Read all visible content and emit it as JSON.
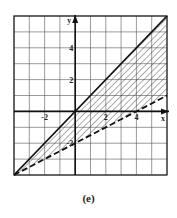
{
  "caption": "(e)",
  "chart_data": {
    "type": "line",
    "title": "",
    "xlabel": "x",
    "ylabel": "y",
    "xlim": [
      -4,
      6
    ],
    "ylim": [
      -4,
      6
    ],
    "grid": true,
    "x_ticks_labeled": [
      "-2",
      "2",
      "4"
    ],
    "y_ticks_labeled": [
      "4",
      "2",
      "-2"
    ],
    "series": [
      {
        "name": "y = x",
        "style": "solid",
        "x": [
          -4,
          6
        ],
        "y": [
          -4,
          6
        ]
      },
      {
        "name": "y = x/2 - 2",
        "style": "dashed",
        "x": [
          -4,
          6
        ],
        "y": [
          -4,
          1
        ]
      }
    ],
    "shaded_region": "between y = x/2 - 2 (dashed, below) and y = x (solid, above), hatched"
  }
}
